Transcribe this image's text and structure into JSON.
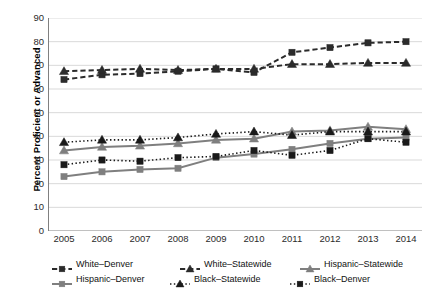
{
  "chart_data": {
    "type": "line",
    "title": "",
    "xlabel": "",
    "ylabel": "Percent Proficient or Advanced",
    "categories": [
      "2005",
      "2006",
      "2007",
      "2008",
      "2009",
      "2010",
      "2011",
      "2012",
      "2013",
      "2014"
    ],
    "ylim": [
      0,
      90
    ],
    "yticks": [
      0,
      10,
      20,
      30,
      40,
      50,
      60,
      70,
      80,
      90
    ],
    "grid": true,
    "legend_position": "bottom",
    "series": [
      {
        "name": "White–Denver",
        "values": [
          64,
          66,
          66.5,
          67.5,
          68.5,
          67,
          75.5,
          77.5,
          79.5,
          80
        ],
        "color": "#2b2b2b",
        "line_style": "dashed",
        "marker": "square",
        "marker_filled": true
      },
      {
        "name": "White–Statewide",
        "values": [
          67.5,
          68,
          68.5,
          68,
          68.5,
          68.5,
          70.5,
          70.5,
          71,
          71
        ],
        "color": "#2b2b2b",
        "line_style": "dashed",
        "marker": "triangle",
        "marker_filled": true
      },
      {
        "name": "Hispanic–Statewide",
        "values": [
          34,
          35.5,
          36,
          37,
          38.5,
          39,
          42,
          42.5,
          44,
          43
        ],
        "color": "#7f7f7f",
        "line_style": "solid",
        "marker": "triangle",
        "marker_filled": true
      },
      {
        "name": "Hispanic–Denver",
        "values": [
          23,
          25,
          26,
          26.5,
          31,
          32.5,
          34.5,
          37,
          39,
          39.5
        ],
        "color": "#7f7f7f",
        "line_style": "solid",
        "marker": "square",
        "marker_filled": true
      },
      {
        "name": "Black–Statewide",
        "values": [
          37.5,
          38.5,
          38.5,
          39.5,
          41,
          42,
          40.5,
          42,
          42,
          42
        ],
        "color": "#1a1a1a",
        "line_style": "dotted",
        "marker": "triangle",
        "marker_filled": true
      },
      {
        "name": "Black–Denver",
        "values": [
          28,
          30,
          29.5,
          31,
          31.5,
          34,
          32,
          34,
          39,
          37.5
        ],
        "color": "#1a1a1a",
        "line_style": "dotted",
        "marker": "square",
        "marker_filled": true
      }
    ]
  },
  "legend": {
    "rows": [
      [
        "White–Denver",
        "White–Statewide",
        "Hispanic–Statewide"
      ],
      [
        "Hispanic–Denver",
        "Black–Statewide",
        "Black–Denver"
      ]
    ]
  },
  "colors": {
    "grid": "#d9d9d9",
    "axis": "#808080",
    "dark": "#2b2b2b",
    "gray": "#7f7f7f",
    "background": "#ffffff"
  }
}
